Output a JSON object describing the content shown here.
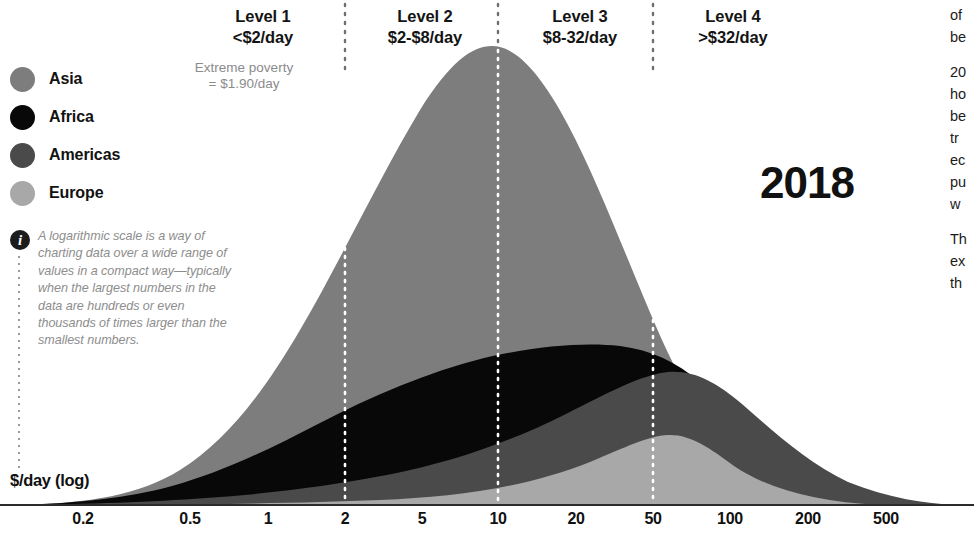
{
  "year_label": "2018",
  "axis": {
    "title": "$/day (log)",
    "scale": "log",
    "ticks": [
      "0.2",
      "0.5",
      "1",
      "2",
      "5",
      "10",
      "20",
      "50",
      "100",
      "200",
      "500"
    ],
    "tick_positions_px": [
      83,
      190,
      268,
      345,
      422,
      498,
      576,
      653,
      730,
      808,
      886
    ]
  },
  "levels": [
    {
      "name": "Level 1",
      "range": "<$2/day"
    },
    {
      "name": "Level 2",
      "range": "$2-$8/day"
    },
    {
      "name": "Level 3",
      "range": "$8-32/day"
    },
    {
      "name": "Level 4",
      "range": ">$32/day"
    }
  ],
  "extreme_poverty": {
    "line1": "Extreme poverty",
    "line2": "= $1.90/day"
  },
  "legend": {
    "items": [
      {
        "label": "Asia",
        "color": "#7d7d7d"
      },
      {
        "label": "Africa",
        "color": "#080808"
      },
      {
        "label": "Americas",
        "color": "#4a4a4a"
      },
      {
        "label": "Europe",
        "color": "#a8a8a8"
      }
    ]
  },
  "note": {
    "icon": "info-icon",
    "text": "A logarithmic scale is a way of charting data over a wide range of values in a compact way—typically when the largest numbers in the data are hundreds or even thousands of times larger than the smallest numbers."
  },
  "side_column": {
    "paragraphs": [
      "of\nbe",
      "20\nho\nbe\ntr\nec\npu\nw",
      "Th\nex\nth"
    ]
  },
  "colors": {
    "asia": "#7d7d7d",
    "africa": "#080808",
    "americas": "#4a4a4a",
    "europe": "#a8a8a8",
    "divider": "#ffffff",
    "axis": "#2b2b2b",
    "muted_text": "#8b8b8b"
  },
  "chart_data": {
    "type": "area",
    "title": "2018",
    "subtitle": "Income distribution by region on a logarithmic $/day scale",
    "xlabel": "$/day (log)",
    "ylabel": "",
    "stacked": true,
    "grid": false,
    "legend_position": "left",
    "xscale": "log",
    "xlim": [
      0.15,
      600
    ],
    "x_ticks": [
      0.2,
      0.5,
      1,
      2,
      5,
      10,
      20,
      50,
      100,
      200,
      500
    ],
    "level_boundaries": [
      2,
      8,
      32
    ],
    "x": [
      0.2,
      0.3,
      0.5,
      0.8,
      1,
      1.5,
      2,
      3,
      5,
      8,
      12,
      20,
      32,
      50,
      80,
      130,
      200,
      320,
      500
    ],
    "series": [
      {
        "name": "Europe",
        "color": "#a8a8a8",
        "values": [
          0,
          0,
          0,
          0,
          0.5,
          1,
          2,
          4,
          8,
          16,
          26,
          38,
          44,
          36,
          20,
          9,
          3,
          1,
          0
        ]
      },
      {
        "name": "Americas",
        "color": "#4a4a4a",
        "values": [
          0,
          0.5,
          1,
          2,
          3,
          5,
          9,
          16,
          27,
          40,
          50,
          56,
          52,
          38,
          21,
          9,
          3,
          1,
          0
        ]
      },
      {
        "name": "Africa",
        "color": "#080808",
        "values": [
          2,
          8,
          20,
          36,
          44,
          56,
          64,
          72,
          78,
          80,
          76,
          64,
          46,
          25,
          11,
          4,
          1,
          0,
          0
        ]
      },
      {
        "name": "Asia",
        "color": "#7d7d7d",
        "values": [
          1,
          5,
          18,
          50,
          78,
          140,
          196,
          272,
          350,
          392,
          372,
          300,
          200,
          110,
          48,
          16,
          4,
          1,
          0
        ]
      }
    ],
    "annotations": [
      {
        "text": "Level 1 · <$2/day"
      },
      {
        "text": "Level 2 · $2-$8/day"
      },
      {
        "text": "Level 3 · $8-32/day"
      },
      {
        "text": "Level 4 · >$32/day"
      },
      {
        "text": "Extreme poverty = $1.90/day"
      }
    ]
  }
}
